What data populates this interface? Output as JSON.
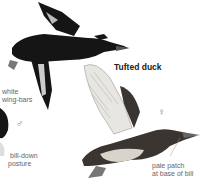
{
  "title": "Tufted duck",
  "labels": {
    "wing_bars_1": "white",
    "wing_bars_2": "wing-bars",
    "male_symbol": "♂",
    "female_symbol": "♀",
    "bill_down_1": "bill-down",
    "bill_down_2": "posture",
    "pale_patch_1": "pale patch",
    "pale_patch_2": "at base of bill"
  },
  "colors": {
    "male_plumage": "#151515",
    "female_plumage": "#3a3530",
    "belly": "#d8d4cc",
    "wing_light": "#e8e6e0"
  }
}
